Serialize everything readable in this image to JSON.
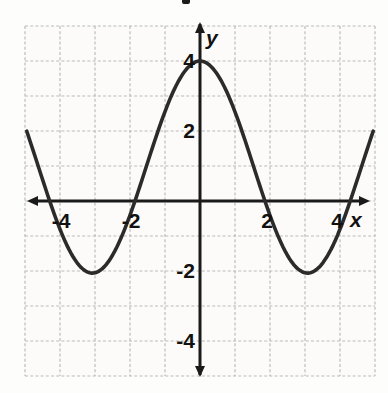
{
  "figure": {
    "colors": {
      "background": "#fdfdfc",
      "plot_background": "#fcfbf9",
      "grid_line": "#bcbcbc",
      "axis": "#1a1a1a",
      "curve": "#2b2b2b",
      "label": "#111111"
    }
  },
  "chart_data": {
    "type": "line",
    "title": "",
    "xlabel": "x",
    "ylabel": "y",
    "xlim": [
      -5,
      5
    ],
    "ylim": [
      -5,
      5
    ],
    "grid": true,
    "grid_spacing": 1,
    "legend": false,
    "x_ticks": [
      {
        "value": -4,
        "label": "-4"
      },
      {
        "value": -2,
        "label": "-2"
      },
      {
        "value": 2,
        "label": "2"
      },
      {
        "value": 4,
        "label": "4"
      }
    ],
    "y_ticks": [
      {
        "value": 4,
        "label": "4"
      },
      {
        "value": 2,
        "label": "2"
      },
      {
        "value": -2,
        "label": "-2"
      },
      {
        "value": -4,
        "label": "-4"
      }
    ],
    "series": [
      {
        "name": "cosine-curve",
        "form": "cosine",
        "amplitude": 3.03,
        "midline": 0.97,
        "period": 6.15,
        "phase": 0,
        "domain": [
          -4.95,
          4.95
        ],
        "key_points": {
          "maximum": [
            0,
            4
          ],
          "minima": [
            [
              -3.1,
              -2.05
            ],
            [
              3.1,
              -2.05
            ]
          ],
          "x_intercepts": [
            -4.3,
            -1.86,
            1.86,
            4.3
          ],
          "y_intercept": [
            0,
            4
          ]
        }
      }
    ]
  }
}
